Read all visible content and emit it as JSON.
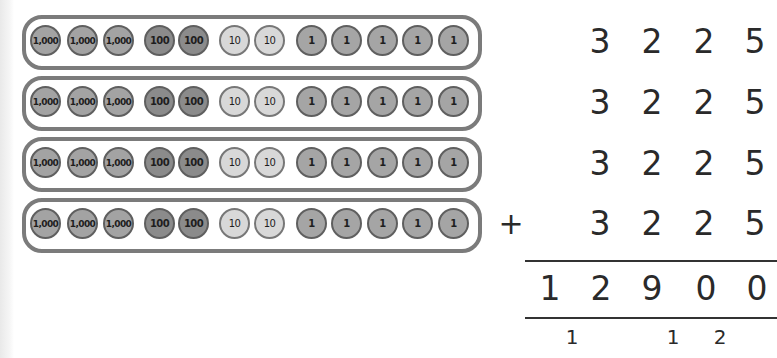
{
  "diagram": {
    "type": "place-value column addition",
    "colors": {
      "row_border": "#7b7b7b",
      "coin_thousand": "#a3a3a3",
      "coin_hundred": "#8b8b8b",
      "coin_ten": "#d8d8d8",
      "coin_one": "#a5a5a5",
      "text": "#2a2a2a"
    },
    "coin_rows": [
      {
        "coins": [
          "1,000",
          "1,000",
          "1,000",
          "100",
          "100",
          "10",
          "10",
          "1",
          "1",
          "1",
          "1",
          "1"
        ]
      },
      {
        "coins": [
          "1,000",
          "1,000",
          "1,000",
          "100",
          "100",
          "10",
          "10",
          "1",
          "1",
          "1",
          "1",
          "1"
        ]
      },
      {
        "coins": [
          "1,000",
          "1,000",
          "1,000",
          "100",
          "100",
          "10",
          "10",
          "1",
          "1",
          "1",
          "1",
          "1"
        ]
      },
      {
        "coins": [
          "1,000",
          "1,000",
          "1,000",
          "100",
          "100",
          "10",
          "10",
          "1",
          "1",
          "1",
          "1",
          "1"
        ]
      }
    ],
    "addends": [
      {
        "digits": [
          "3",
          "2",
          "2",
          "5"
        ]
      },
      {
        "digits": [
          "3",
          "2",
          "2",
          "5"
        ]
      },
      {
        "digits": [
          "3",
          "2",
          "2",
          "5"
        ]
      },
      {
        "digits": [
          "3",
          "2",
          "2",
          "5"
        ]
      }
    ],
    "operator": "+",
    "sum": {
      "digits": [
        "1",
        "2",
        "9",
        "0",
        "0"
      ]
    },
    "carries": [
      "1",
      "1",
      "2"
    ]
  }
}
